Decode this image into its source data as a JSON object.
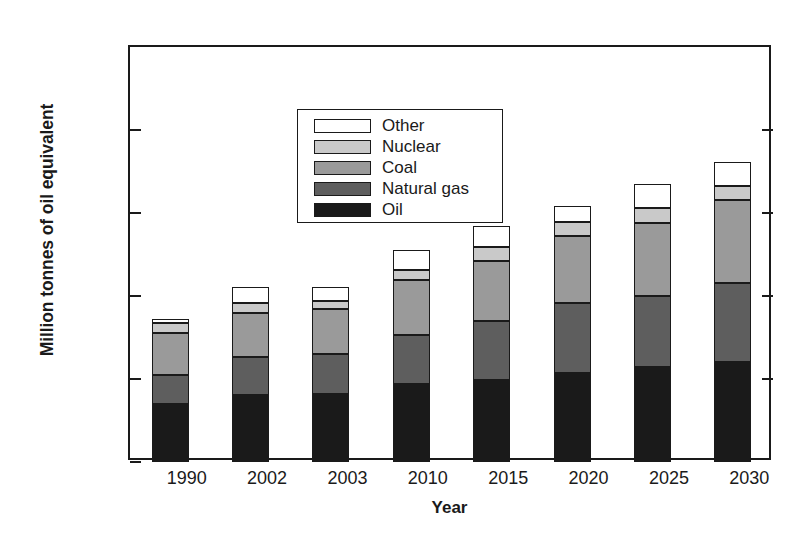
{
  "chart_data": {
    "type": "bar",
    "stacked": true,
    "title": "",
    "xlabel": "Year",
    "ylabel": "Million tonnes of oil equivalent",
    "categories": [
      "1990",
      "2002",
      "2003",
      "2010",
      "2015",
      "2020",
      "2025",
      "2030"
    ],
    "ylim": [
      0,
      25000
    ],
    "ytick_values": [
      0,
      5000,
      10000,
      15000,
      20000,
      25000
    ],
    "ytick_labels": [
      "0",
      "5000",
      "10 000",
      "15 000",
      "20 000",
      "25 000"
    ],
    "grid": false,
    "legend_position": "upper left inside",
    "series": [
      {
        "name": "Oil",
        "color": "#1a1a1a",
        "values": [
          3500,
          4050,
          4100,
          4700,
          4950,
          5350,
          5700,
          6000
        ]
      },
      {
        "name": "Natural gas",
        "color": "#5e5e5e",
        "values": [
          1750,
          2300,
          2400,
          2950,
          3550,
          4200,
          4300,
          4800
        ]
      },
      {
        "name": "Coal",
        "color": "#9a9a9a",
        "values": [
          2550,
          2600,
          2700,
          3300,
          3600,
          4050,
          4400,
          5000
        ]
      },
      {
        "name": "Nuclear",
        "color": "#c9c9c9",
        "values": [
          550,
          600,
          500,
          600,
          850,
          850,
          900,
          850
        ]
      },
      {
        "name": "Other",
        "color": "#ffffff",
        "values": [
          250,
          1000,
          850,
          1250,
          1250,
          1000,
          1450,
          1450
        ]
      }
    ],
    "totals": [
      8600,
      10550,
      10550,
      12800,
      14200,
      15450,
      16750,
      18100
    ]
  },
  "legend": {
    "items": [
      {
        "label": "Other"
      },
      {
        "label": "Nuclear"
      },
      {
        "label": "Coal"
      },
      {
        "label": "Natural gas"
      },
      {
        "label": "Oil"
      }
    ]
  },
  "axes": {
    "y_title": "Million tonnes of oil equivalent",
    "x_title": "Year"
  },
  "colors": {
    "axis": "#1a1a1a",
    "background": "#ffffff",
    "oil": "#1a1a1a",
    "natural_gas": "#5e5e5e",
    "coal": "#9a9a9a",
    "nuclear": "#c9c9c9",
    "other": "#ffffff"
  }
}
